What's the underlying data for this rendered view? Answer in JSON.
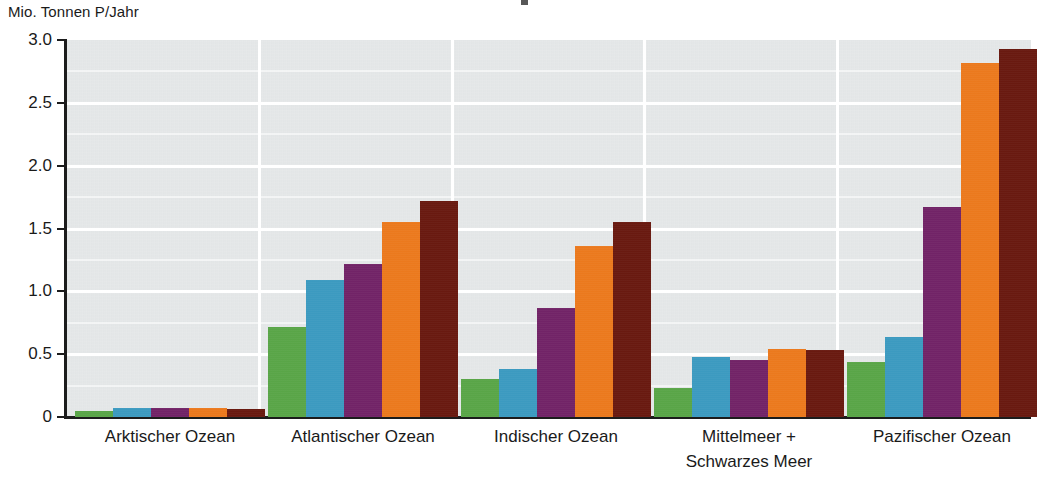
{
  "chart_data": {
    "type": "bar",
    "title": "",
    "subtitle": "",
    "xlabel": "",
    "ylabel": "Mio. Tonnen P/Jahr",
    "ylim": [
      0,
      3.0
    ],
    "grid": true,
    "legend_position": "none",
    "yticks": [
      "0",
      "0.5",
      "1.0",
      "1.5",
      "2.0",
      "2.5",
      "3.0"
    ],
    "ytick_values": [
      0,
      0.5,
      1.0,
      1.5,
      2.0,
      2.5,
      3.0
    ],
    "categories": [
      "Arktischer Ozean",
      "Atlantischer Ozean",
      "Indischer Ozean",
      "Mittelmeer +|Schwarzes Meer",
      "Pazifischer Ozean"
    ],
    "category_lines": [
      [
        "Arktischer Ozean"
      ],
      [
        "Atlantischer Ozean"
      ],
      [
        "Indischer Ozean"
      ],
      [
        "Mittelmeer +",
        "Schwarzes Meer"
      ],
      [
        "Pazifischer Ozean"
      ]
    ],
    "series": [
      {
        "name": "series-1",
        "color": "#5ba949",
        "values": [
          0.05,
          0.72,
          0.3,
          0.23,
          0.44
        ]
      },
      {
        "name": "series-2",
        "color": "#3d9dc4",
        "values": [
          0.07,
          1.09,
          0.38,
          0.48,
          0.64
        ]
      },
      {
        "name": "series-3",
        "color": "#742469",
        "values": [
          0.07,
          1.22,
          0.87,
          0.45,
          1.67
        ]
      },
      {
        "name": "series-4",
        "color": "#f07c1e",
        "values": [
          0.07,
          1.55,
          1.36,
          0.54,
          2.82
        ]
      },
      {
        "name": "series-5",
        "color": "#6b1a10",
        "values": [
          0.06,
          1.72,
          1.55,
          0.53,
          2.93
        ]
      }
    ],
    "colors": {
      "plot_background": "#e3e6e7",
      "gridline": "#ffffff",
      "axis": "#1c1c1c",
      "page_background": "#ffffff"
    }
  },
  "axis": {
    "y_unit_caption": "Mio. Tonnen P/Jahr"
  }
}
